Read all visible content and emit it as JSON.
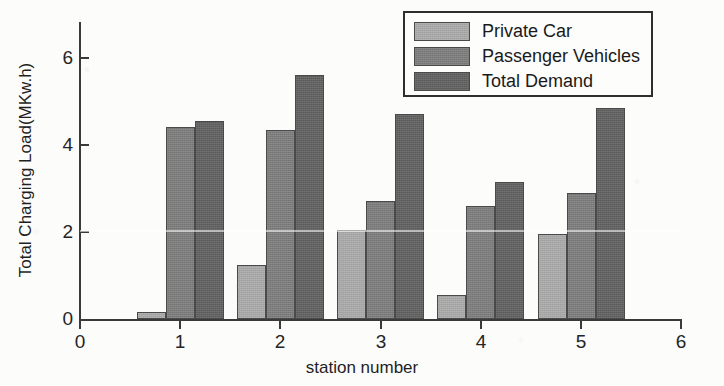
{
  "chart_data": {
    "type": "bar",
    "title": "",
    "xlabel": "station number",
    "ylabel": "Total Charging Load(MKw.h)",
    "categories": [
      "1",
      "2",
      "3",
      "4",
      "5"
    ],
    "series": [
      {
        "name": "Private Car",
        "color": "#a9a9a9",
        "values": [
          0.15,
          1.25,
          2.05,
          0.55,
          1.95
        ]
      },
      {
        "name": "Passenger Vehicles",
        "color": "#7b7b7b",
        "values": [
          4.4,
          4.35,
          2.7,
          2.6,
          2.9
        ]
      },
      {
        "name": "Total Demand",
        "color": "#5e5e5e",
        "values": [
          4.55,
          5.6,
          4.7,
          3.15,
          4.85
        ]
      }
    ],
    "xlim": [
      0,
      6
    ],
    "ylim": [
      0,
      6.8
    ],
    "xticks": [
      "0",
      "1",
      "2",
      "3",
      "4",
      "5",
      "6"
    ],
    "yticks": [
      "0",
      "2",
      "4",
      "6"
    ],
    "grid": false,
    "legend_position": "top-right"
  },
  "legend": {
    "entries": [
      {
        "label": "Private Car"
      },
      {
        "label": "Passenger Vehicles"
      },
      {
        "label": "Total Demand"
      }
    ]
  },
  "axes": {
    "y_title": "Total Charging Load(MKw.h)",
    "x_title": "station number",
    "y_tick_labels": [
      "0",
      "2",
      "4",
      "6"
    ],
    "x_tick_labels": [
      "0",
      "1",
      "2",
      "3",
      "4",
      "5",
      "6"
    ]
  }
}
